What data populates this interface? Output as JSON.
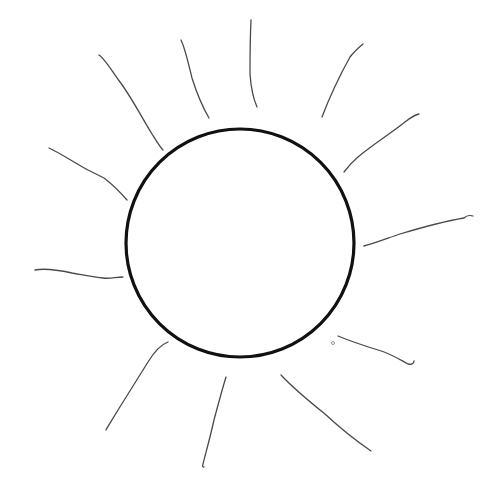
{
  "drawing": {
    "subject": "sun sketch",
    "background": "#ffffff",
    "sun": {
      "cx": 240,
      "cy": 243,
      "r": 114,
      "stroke": "#111111",
      "stroke_width": 3.2
    },
    "ray_style": {
      "stroke": "#4a4a4a",
      "stroke_width": 1.3
    },
    "rays": [
      {
        "d": "M49,148 C60,153 75,163 88,170 C96,174 100,176 104,178 C112,184 120,192 127,200"
      },
      {
        "d": "M99,55 C104,58 110,68 120,82 C132,98 142,118 152,134 C157,142 160,147 163,150"
      },
      {
        "d": "M181,40 C185,48 188,62 192,78 C197,94 202,106 209,118"
      },
      {
        "d": "M251,20 C250,40 250,58 250,74 C251,88 253,98 257,107"
      },
      {
        "d": "M363,44 C357,49 353,53 350,57 C340,75 330,96 322,117"
      },
      {
        "d": "M419,114 C415,115 410,118 405,122 C390,134 372,145 358,157 C352,162 347,168 344,172"
      },
      {
        "d": "M473,216 C470,215 466,216 464,218 C440,222 420,228 400,234 C388,238 376,243 364,246"
      },
      {
        "d": "M338,336 C350,341 365,346 378,350 C392,354 402,361 408,364 C412,365 414,363 414,361"
      },
      {
        "d": "M281,375 C295,390 310,402 325,414 C340,428 355,440 371,451"
      },
      {
        "d": "M226,377 C222,390 218,405 214,420 C210,438 206,452 203,464 C202,467 203,467 204,467"
      },
      {
        "d": "M168,342 C160,345 154,352 148,362 C138,378 128,394 118,410 C112,420 108,426 106,430"
      },
      {
        "d": "M35,270 C45,268 58,270 72,273 C84,275 95,277 103,278 C110,279 116,277 123,277"
      }
    ],
    "speck": {
      "cx": 333,
      "cy": 343,
      "r": 1.5
    }
  }
}
